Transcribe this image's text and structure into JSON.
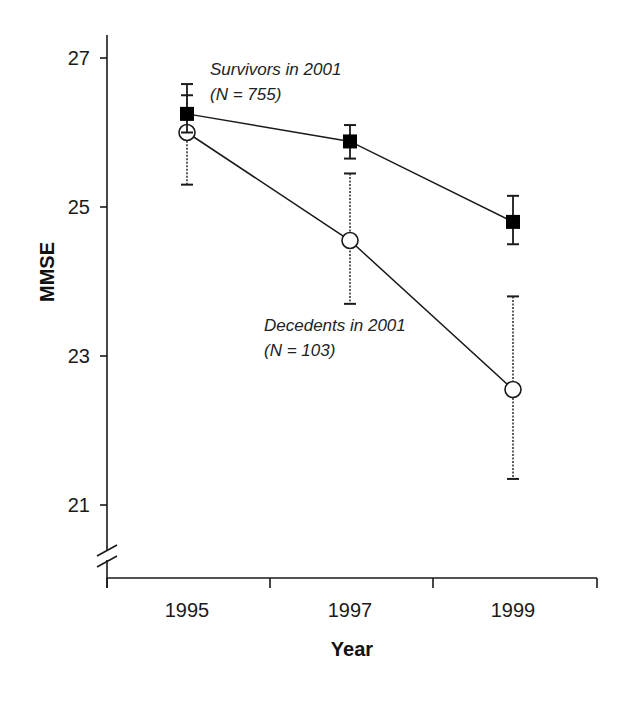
{
  "chart_data": {
    "type": "line",
    "title": "",
    "xlabel": "Year",
    "ylabel": "MMSE",
    "categories": [
      "1995",
      "1997",
      "1999"
    ],
    "yticks": [
      21,
      23,
      25,
      27
    ],
    "ylim": [
      20,
      27.4
    ],
    "axis_break": true,
    "grid": false,
    "legend": "inline annotations",
    "series": [
      {
        "name": "Survivors in 2001",
        "n_label": "(N = 755)",
        "marker": "filled-square",
        "error_style": "solid",
        "values": [
          26.25,
          25.88,
          24.8
        ],
        "err_upper": [
          26.65,
          26.1,
          25.15
        ],
        "err_lower": [
          26.0,
          25.65,
          24.5
        ]
      },
      {
        "name": "Decedents in 2001",
        "n_label": "(N = 103)",
        "marker": "open-circle",
        "error_style": "dotted",
        "values": [
          26.0,
          24.55,
          22.55
        ],
        "err_upper": [
          26.5,
          25.45,
          23.8
        ],
        "err_lower": [
          25.3,
          23.7,
          21.35
        ]
      }
    ]
  },
  "labels": {
    "ylabel": "MMSE",
    "xlabel": "Year",
    "survivors_line1": "Survivors in 2001",
    "survivors_line2": "(N = 755)",
    "decedents_line1": "Decedents in 2001",
    "decedents_line2": "(N = 103)"
  },
  "colors": {
    "ink": "#1a1a1a",
    "background": "#ffffff"
  }
}
